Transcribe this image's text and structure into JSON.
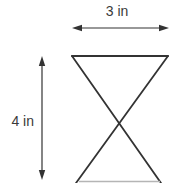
{
  "figure": {
    "width_label": "3 in",
    "height_label": "4 in",
    "width_value": 3,
    "height_value": 4,
    "unit": "in",
    "line_color": "#333333",
    "text_color": "#3a3a3a",
    "faint_line_color": "#b5b5b5",
    "background": "#ffffff"
  }
}
